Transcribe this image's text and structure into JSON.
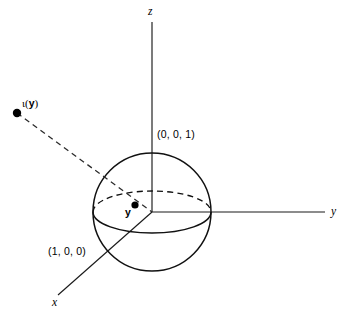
{
  "figure": {
    "canvas": {
      "width": 349,
      "height": 317,
      "background": "#ffffff"
    },
    "stroke_color": "#111111",
    "text_color": "#000000"
  },
  "axes": {
    "z_label": "z",
    "y_label": "y",
    "x_label": "x",
    "origin": {
      "x": 152,
      "y": 212
    },
    "z_axis": {
      "x1": 152,
      "y1": 22,
      "x2": 152,
      "y2": 212
    },
    "y_axis": {
      "x1": 152,
      "y1": 212,
      "x2": 325,
      "y2": 212
    },
    "x_axis": {
      "x1": 152,
      "y1": 212,
      "x2": 58,
      "y2": 295
    }
  },
  "sphere": {
    "center_x": 152,
    "center_y": 212,
    "radius": 59,
    "equator_rx": 59,
    "equator_ry": 21
  },
  "labels": {
    "north_pole": "(0, 0, 1)",
    "x_intercept": "(1, 0, 0)",
    "interior_point": "y",
    "exterior_point_prefix": "ι(",
    "exterior_point_arg": "y",
    "exterior_point_suffix": ")",
    "exterior_point_full": "ι(y)"
  },
  "points": [
    {
      "name": "interior-point-y",
      "label": "y",
      "x": 135,
      "y": 205,
      "radius": 3.6
    },
    {
      "name": "exterior-point-iota-y",
      "label": "ι(y)",
      "x": 17,
      "y": 113,
      "radius": 4.2
    }
  ],
  "ray": {
    "name": "inversion-ray",
    "from": {
      "x": 17,
      "y": 113
    },
    "to": {
      "x": 152,
      "y": 212
    },
    "style": "dashed"
  }
}
